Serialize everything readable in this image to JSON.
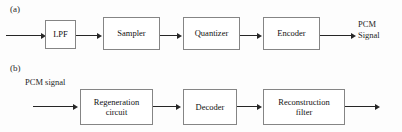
{
  "figure": {
    "background_color": "#fdfdfd",
    "box_border_color": "#858585",
    "arrow_color": "#262626"
  },
  "panels": [
    {
      "id": "a",
      "label": "(a)",
      "caption": "PCM transmitter chain",
      "input_label": "",
      "output_label": "PCM\nSignal",
      "output_label_line1": "PCM",
      "output_label_line2": "Signal",
      "blocks": [
        {
          "id": "lpf",
          "label": "LPF"
        },
        {
          "id": "sampler",
          "label": "Sampler"
        },
        {
          "id": "quantizer",
          "label": "Quantizer"
        },
        {
          "id": "encoder",
          "label": "Encoder"
        }
      ]
    },
    {
      "id": "b",
      "label": "(b)",
      "caption": "PCM receiver chain",
      "input_label": "PCM signal",
      "output_label": "",
      "blocks": [
        {
          "id": "regeneration-circuit",
          "label": "Regeneration\ncircuit"
        },
        {
          "id": "decoder",
          "label": "Decoder"
        },
        {
          "id": "reconstruction-filter",
          "label": "Reconstruction\nfilter"
        }
      ]
    }
  ]
}
